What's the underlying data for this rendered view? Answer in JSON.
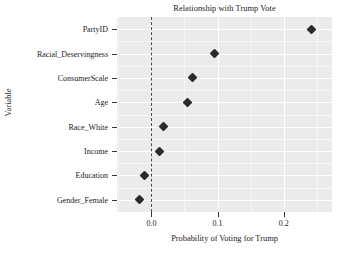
{
  "chart_data": {
    "type": "scatter",
    "title": "Relationship with Trump Vote",
    "xlabel": "Probability of Voting for Trump",
    "ylabel": "Variable",
    "categories": [
      "PartyID",
      "Racial_Deservingness",
      "ConsumerScale",
      "Age",
      "Race_White",
      "Income",
      "Education",
      "Gender_Female"
    ],
    "values": [
      0.242,
      0.096,
      0.062,
      0.054,
      0.019,
      0.012,
      -0.011,
      -0.018
    ],
    "xticks": [
      0.0,
      0.1,
      0.2
    ],
    "xtick_labels": [
      "0.0",
      "0.1",
      "0.2"
    ],
    "xlim": [
      -0.052,
      0.273
    ],
    "grid": true,
    "legend": "none",
    "reference_line": {
      "value": 0.0,
      "style": "dashed",
      "color": "#4c4c4c"
    },
    "marker": {
      "shape": "diamond",
      "color": "#2b2b2b"
    },
    "panel_background": "#ebebeb",
    "gridline_color": "#ffffff"
  }
}
